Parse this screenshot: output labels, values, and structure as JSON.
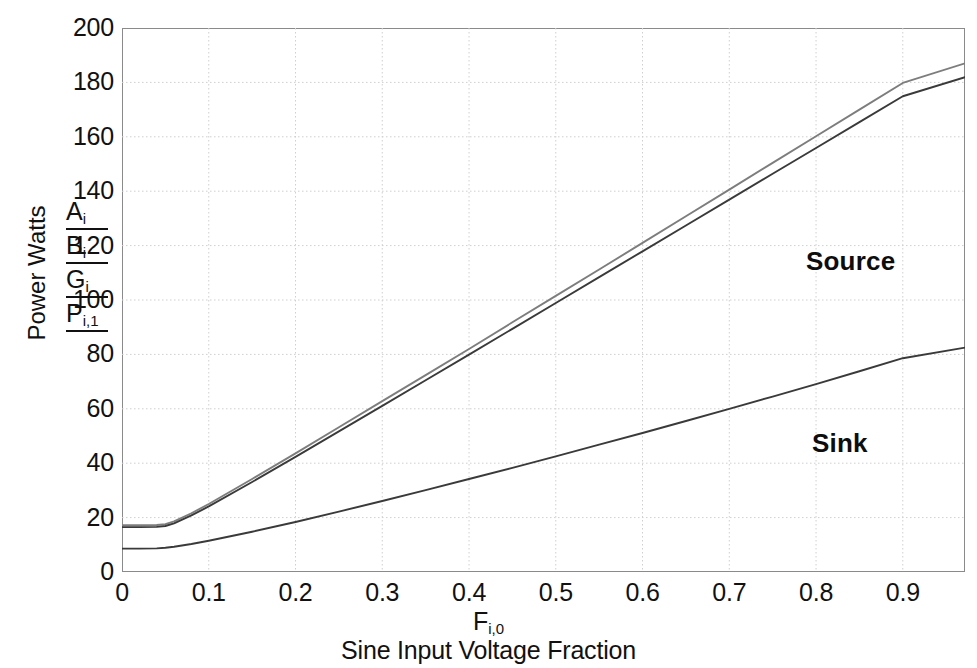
{
  "chart_data": {
    "type": "line",
    "title": "",
    "xlabel": "Sine Input Voltage Fraction",
    "xlabel_symbol": "F",
    "xlabel_symbol_sub": "i,0",
    "ylabel": "Power Watts",
    "ylabel_symbols": [
      "A",
      "B",
      "G",
      "P"
    ],
    "ylabel_symbol_subs": [
      "i",
      "i",
      "i",
      "i,1"
    ],
    "xlim": [
      0,
      0.9717
    ],
    "ylim": [
      0,
      200
    ],
    "xticks": [
      "0",
      "0.1",
      "0.2",
      "0.3",
      "0.4",
      "0.5",
      "0.6",
      "0.7",
      "0.8",
      "0.9"
    ],
    "xtick_values": [
      0,
      0.1,
      0.2,
      0.3,
      0.4,
      0.5,
      0.6,
      0.7,
      0.8,
      0.9
    ],
    "yticks": [
      "0",
      "20",
      "40",
      "60",
      "80",
      "100",
      "120",
      "140",
      "160",
      "180",
      "200"
    ],
    "ytick_values": [
      0,
      20,
      40,
      60,
      80,
      100,
      120,
      140,
      160,
      180,
      200
    ],
    "grid": true,
    "grid_color": "#cfcfcf",
    "legend_position": "inline-annotations",
    "annotations": [
      {
        "text": "Source",
        "x": 0.79,
        "y": 112
      },
      {
        "text": "Sink",
        "x": 0.8,
        "y": 45
      }
    ],
    "x": [
      0,
      0.02,
      0.04,
      0.05,
      0.06,
      0.08,
      0.1,
      0.15,
      0.2,
      0.25,
      0.3,
      0.35,
      0.4,
      0.45,
      0.5,
      0.55,
      0.6,
      0.65,
      0.7,
      0.75,
      0.8,
      0.85,
      0.9,
      0.9717
    ],
    "series": [
      {
        "name": "Source upper",
        "color": "#7d7d7d",
        "values": [
          17.2,
          17.2,
          17.3,
          17.6,
          18.6,
          21.6,
          25.0,
          34.2,
          43.6,
          53.2,
          62.8,
          72.4,
          82.0,
          91.8,
          101.5,
          111.2,
          121.0,
          130.8,
          140.6,
          150.4,
          160.2,
          170.0,
          179.8,
          187.0
        ]
      },
      {
        "name": "Source lower",
        "color": "#3a3a3a",
        "values": [
          16.5,
          16.5,
          16.6,
          16.9,
          17.9,
          20.8,
          24.1,
          33.1,
          42.3,
          51.7,
          61.1,
          70.5,
          79.9,
          89.4,
          98.9,
          108.4,
          117.9,
          127.4,
          136.9,
          146.4,
          155.9,
          165.4,
          174.9,
          181.9
        ]
      },
      {
        "name": "Sink",
        "color": "#3a3a3a",
        "values": [
          8.6,
          8.6,
          8.7,
          8.9,
          9.3,
          10.3,
          11.5,
          14.8,
          18.4,
          22.2,
          26.1,
          30.1,
          34.2,
          38.3,
          42.5,
          46.8,
          51.1,
          55.5,
          60.0,
          64.5,
          69.1,
          73.8,
          78.6,
          82.5
        ]
      }
    ]
  },
  "axes": {
    "y_title": "Power Watts",
    "y_symbols": [
      {
        "base": "A",
        "sub": "i"
      },
      {
        "base": "B",
        "sub": "i"
      },
      {
        "base": "G",
        "sub": "i"
      },
      {
        "base": "P",
        "sub": "i,1"
      }
    ],
    "x_symbol_base": "F",
    "x_symbol_sub": "i,0",
    "x_caption": "Sine Input Voltage Fraction"
  },
  "annotations": {
    "source": "Source",
    "sink": "Sink"
  },
  "colors": {
    "axis": "#8a8a8a",
    "grid": "#cfcfcf",
    "line_dark": "#3a3a3a",
    "line_gray": "#7d7d7d",
    "text": "#111111"
  }
}
